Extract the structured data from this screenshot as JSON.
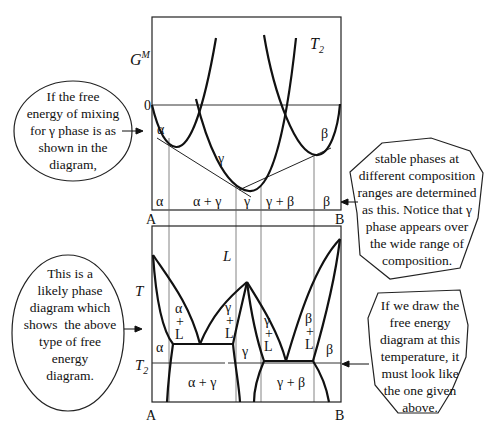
{
  "top_plot": {
    "y_axis_label": "G",
    "y_axis_label_sup": "M",
    "zero_label": "0",
    "temperature_label": "T",
    "temperature_sub": "2",
    "curve_labels": {
      "alpha": "α",
      "gamma": "γ",
      "beta": "β"
    },
    "region_labels": [
      "α",
      "α + γ",
      "γ",
      "γ + β",
      "β"
    ],
    "x_left": "A",
    "x_right": "B"
  },
  "bottom_plot": {
    "y_axis_label": "T",
    "t2_label": "T",
    "t2_sub": "2",
    "liquid_label": "L",
    "two_phase_liquid_labels": [
      {
        "phase": "α",
        "plus": "+",
        "liquid": "L"
      },
      {
        "phase": "γ",
        "plus": "+",
        "liquid": "L"
      },
      {
        "phase": "γ",
        "plus": "+",
        "liquid": "L"
      },
      {
        "phase": "β",
        "plus": "+",
        "liquid": "L"
      }
    ],
    "single_phase_labels": {
      "alpha": "α",
      "gamma": "γ",
      "beta": "β"
    },
    "solid_two_phase_labels": [
      "α + γ",
      "γ + β"
    ],
    "x_left": "A",
    "x_right": "B"
  },
  "notes": {
    "top_left": [
      "If the free",
      "energy of mixing",
      "for γ phase is as",
      "shown in the",
      "diagram,"
    ],
    "top_right": [
      "stable phases at",
      "different composition",
      "ranges are determined",
      "as this. Notice that γ",
      "phase appears over",
      "the wide range of",
      "composition."
    ],
    "bottom_left": [
      "This is a",
      "likely phase",
      "diagram which",
      "shows  the above",
      "type of free",
      "energy",
      "diagram."
    ],
    "bottom_right": [
      "If we draw the",
      "free energy",
      "diagram at this",
      "temperature, it",
      "must look like",
      "the one given",
      "above."
    ]
  }
}
